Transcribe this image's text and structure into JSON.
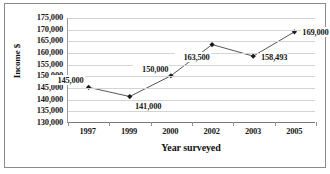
{
  "chart_data": {
    "type": "line",
    "title": "",
    "xlabel": "Year surveyed",
    "ylabel": "Income $",
    "categories": [
      "1997",
      "1999",
      "2000",
      "2002",
      "2003",
      "2005"
    ],
    "values": [
      145000,
      141000,
      150000,
      163500,
      158493,
      169000
    ],
    "point_labels": [
      "145,000",
      "141,000",
      "150,000",
      "163,500",
      "158,493",
      "169,000"
    ],
    "ylim": [
      130000,
      175000
    ],
    "ytick_values": [
      175000,
      170000,
      165000,
      160000,
      155000,
      150000,
      145000,
      140000,
      135000,
      130000
    ],
    "ytick_labels": [
      "175,000",
      "170,000",
      "165,000",
      "160,000",
      "155,000",
      "150,000",
      "145,000",
      "140,000",
      "135,000",
      "130,000"
    ],
    "grid": true,
    "legend": "none",
    "series": [
      {
        "name": "Income",
        "values": [
          145000,
          141000,
          150000,
          163500,
          158493,
          169000
        ]
      }
    ],
    "colors": {
      "line": "#555555",
      "marker": "#1a1a1a",
      "grid": "#d4d4d4",
      "axis": "#7a7a7a",
      "text": "#1a1a1a",
      "background": "#ffffff",
      "frame": "#8a8a8a"
    }
  }
}
